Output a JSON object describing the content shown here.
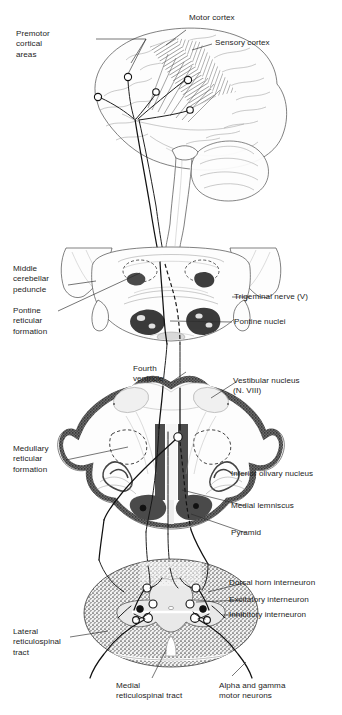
{
  "figure": {
    "title_visible": false,
    "type": "anatomical-diagram",
    "sections": [
      {
        "name": "cerebrum",
        "label": "cerebral hemisphere lateral view"
      },
      {
        "name": "pons",
        "label": "pons cross section"
      },
      {
        "name": "medulla",
        "label": "medulla cross section"
      },
      {
        "name": "spinal-cord",
        "label": "spinal cord cross section"
      }
    ]
  },
  "labels": {
    "premotor_cortical_areas": "Premotor\ncortical\nareas",
    "motor_cortex": "Motor cortex",
    "sensory_cortex": "Sensory cortex",
    "middle_cerebellar_peduncle": "Middle\ncerebellar\npeduncle",
    "pontine_reticular_formation": "Pontine\nreticular\nformation",
    "trigeminal_nerve": "Trigeminal nerve (V)",
    "pontine_nuclei": "Pontine nuclei",
    "fourth_ventricle": "Fourth\nventricle",
    "vestibular_nucleus": "Vestibular nucleus\n(N. VIII)",
    "medullary_reticular_formation": "Medullary\nreticular\nformation",
    "inferior_olivary_nucleus": "Inferior olivary nucleus",
    "medial_lemniscus": "Medial lemniscus",
    "pyramid": "Pyramid",
    "dorsal_horn_interneuron": "Dorsal horn interneuron",
    "excitatory_interneuron": "Excitatory interneuron",
    "inhibitory_interneuron": "Inhibitory  interneuron",
    "lateral_reticulospinal_tract": "Lateral\nreticulospinal\ntract",
    "medial_reticulospinal_tract": "Medial\nreticulospinal tract",
    "alpha_and_gamma_motor_neurons": "Alpha and gamma\nmotor neurons"
  },
  "colors": {
    "background": "#ffffff",
    "text": "#1d1d1d",
    "leader_line": "#2b2b2b",
    "axon": "#111111",
    "tissue_outline": "#4a4a4a",
    "gray_matter": "#9a9a9a",
    "white_matter_dark": "#5d5d5d"
  }
}
